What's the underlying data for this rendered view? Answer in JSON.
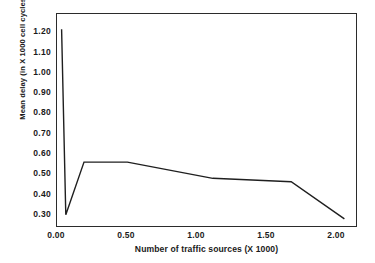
{
  "chart_data": {
    "type": "line",
    "title": "",
    "xlabel": "Number of traffic sources (X 1000)",
    "ylabel": "Mean delay (in X 1000 cell cycles)",
    "xlim": [
      0.0,
      2.15
    ],
    "ylim": [
      0.235,
      1.29
    ],
    "grid": false,
    "legend": null,
    "xticks": [
      {
        "value": 0.0,
        "label": "0.00"
      },
      {
        "value": 0.5,
        "label": "0.50"
      },
      {
        "value": 1.0,
        "label": "1.00"
      },
      {
        "value": 1.5,
        "label": "1.50"
      },
      {
        "value": 2.0,
        "label": "2.00"
      }
    ],
    "yticks": [
      {
        "value": 1.2,
        "label": "1.20"
      },
      {
        "value": 1.1,
        "label": "1.10"
      },
      {
        "value": 1.0,
        "label": "1.00"
      },
      {
        "value": 0.9,
        "label": "0.90"
      },
      {
        "value": 0.8,
        "label": "0.80"
      },
      {
        "value": 0.7,
        "label": "0.70"
      },
      {
        "value": 0.6,
        "label": "0.60"
      },
      {
        "value": 0.5,
        "label": "0.50"
      },
      {
        "value": 0.4,
        "label": "0.40"
      },
      {
        "value": 0.3,
        "label": "0.30"
      }
    ],
    "series": [
      {
        "name": "mean delay",
        "color": "#1f1f1f",
        "x": [
          0.04,
          0.07,
          0.2,
          0.51,
          1.12,
          1.68,
          2.06
        ],
        "y": [
          1.21,
          0.295,
          0.555,
          0.555,
          0.475,
          0.458,
          0.275
        ]
      }
    ]
  }
}
